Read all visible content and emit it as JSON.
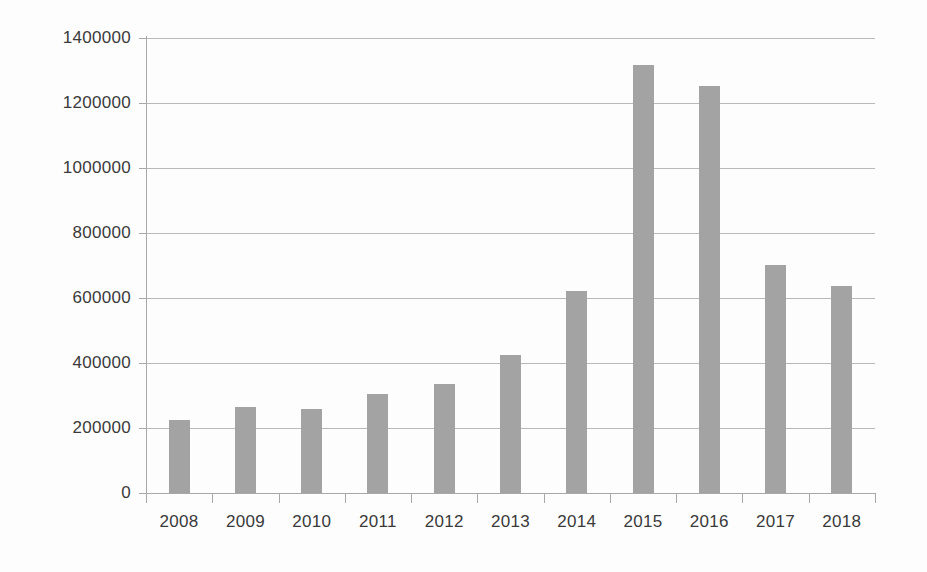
{
  "chart_data": {
    "type": "bar",
    "title": "",
    "subtitle": "",
    "xlabel": "",
    "ylabel": "",
    "categories": [
      "2008",
      "2009",
      "2010",
      "2011",
      "2012",
      "2013",
      "2014",
      "2015",
      "2016",
      "2017",
      "2018"
    ],
    "values": [
      225000,
      265000,
      258000,
      305000,
      335000,
      425000,
      622000,
      1318000,
      1252000,
      702000,
      637000
    ],
    "ylim": [
      0,
      1400000
    ],
    "y_ticks": [
      0,
      200000,
      400000,
      600000,
      800000,
      1000000,
      1200000,
      1400000
    ],
    "y_tick_labels": [
      "0",
      "200000",
      "400000",
      "600000",
      "800000",
      "1000000",
      "1200000",
      "1400000"
    ],
    "grid": true,
    "legend": false,
    "legend_position": "none",
    "bar_color": "#a3a3a3",
    "gridline_color": "#b9b9b9",
    "axis_color": "#a8a8a8",
    "text_color": "#3a3a3a",
    "background_color": "#fdfdfd"
  }
}
